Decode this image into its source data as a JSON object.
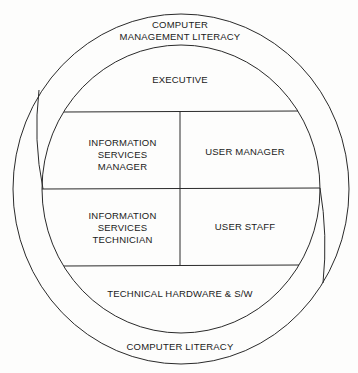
{
  "diagram": {
    "type": "nested-circle",
    "outer_ring_top_label": "COMPUTER\nMANAGEMENT LITERACY",
    "outer_ring_bottom_label": "COMPUTER LITERACY",
    "inner": {
      "top": "EXECUTIVE",
      "cells": [
        {
          "row": 1,
          "col": 1,
          "label": "INFORMATION\nSERVICES\nMANAGER"
        },
        {
          "row": 1,
          "col": 2,
          "label": "USER MANAGER"
        },
        {
          "row": 2,
          "col": 1,
          "label": "INFORMATION\nSERVICES\nTECHNICIAN"
        },
        {
          "row": 2,
          "col": 2,
          "label": "USER STAFF"
        }
      ],
      "bottom": "TECHNICAL HARDWARE & S/W"
    },
    "line_color": "#2a2a2a"
  }
}
